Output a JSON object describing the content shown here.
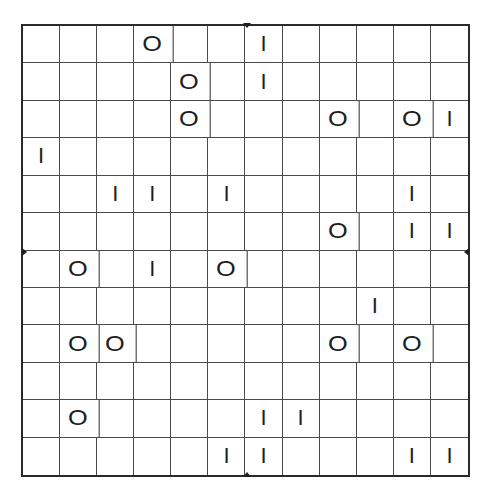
{
  "puzzle": {
    "rows": 12,
    "cols": 12,
    "symbols": {
      "O": "O",
      "I": "I"
    },
    "grid": [
      [
        "",
        "",
        "",
        "O",
        "",
        "",
        "I",
        "",
        "",
        "",
        "",
        ""
      ],
      [
        "",
        "",
        "",
        "",
        "O",
        "",
        "I",
        "",
        "",
        "",
        "",
        ""
      ],
      [
        "",
        "",
        "",
        "",
        "O",
        "",
        "",
        "",
        "O",
        "",
        "O",
        "I"
      ],
      [
        "I",
        "",
        "",
        "",
        "",
        "",
        "",
        "",
        "",
        "",
        "",
        ""
      ],
      [
        "",
        "",
        "I",
        "I",
        "",
        "I",
        "",
        "",
        "",
        "",
        "I",
        ""
      ],
      [
        "",
        "",
        "",
        "",
        "",
        "",
        "",
        "",
        "O",
        "",
        "I",
        "I"
      ],
      [
        "",
        "O",
        "",
        "I",
        "",
        "O",
        "",
        "",
        "",
        "",
        "",
        ""
      ],
      [
        "",
        "",
        "",
        "",
        "",
        "",
        "",
        "",
        "",
        "I",
        "",
        ""
      ],
      [
        "",
        "O",
        "O",
        "",
        "",
        "",
        "",
        "",
        "O",
        "",
        "O",
        ""
      ],
      [
        "",
        "",
        "",
        "",
        "",
        "",
        "",
        "",
        "",
        "",
        "",
        ""
      ],
      [
        "",
        "O",
        "",
        "",
        "",
        "",
        "I",
        "I",
        "",
        "",
        "",
        ""
      ],
      [
        "",
        "",
        "",
        "",
        "",
        "I",
        "I",
        "",
        "",
        "",
        "I",
        "I"
      ]
    ]
  }
}
